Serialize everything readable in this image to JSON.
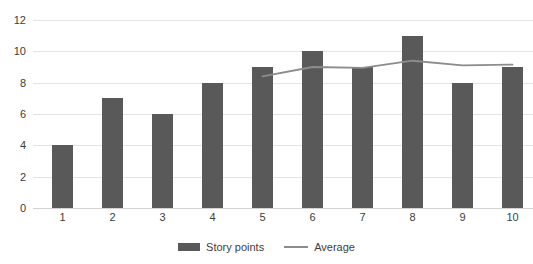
{
  "chart_data": {
    "type": "bar",
    "title": "",
    "subtitle": "",
    "xlabel": "",
    "ylabel": "",
    "categories": [
      "1",
      "2",
      "3",
      "4",
      "5",
      "6",
      "7",
      "8",
      "9",
      "10"
    ],
    "ylim": [
      0,
      12
    ],
    "y_ticks": [
      0,
      2,
      4,
      6,
      8,
      10,
      12
    ],
    "y_tick_labels": [
      "0",
      "2",
      "4",
      "6",
      "8",
      "10",
      "12"
    ],
    "grid": true,
    "legend_position": "bottom-center",
    "series": [
      {
        "name": "Story points",
        "type": "bar",
        "color": "#595959",
        "values": [
          4,
          7,
          6,
          8,
          9,
          10,
          9,
          11,
          8,
          9
        ]
      },
      {
        "name": "Average",
        "type": "line",
        "color": "#8c8c8c",
        "x": [
          "5",
          "6",
          "7",
          "8",
          "9",
          "10"
        ],
        "values": [
          8.4,
          9.0,
          8.95,
          9.4,
          9.1,
          9.15
        ]
      }
    ]
  },
  "legend": {
    "entries": [
      {
        "label": "Story points",
        "marker": "bar-swatch"
      },
      {
        "label": "Average",
        "marker": "line-swatch"
      }
    ]
  },
  "colors": {
    "bar": "#595959",
    "line": "#8c8c8c",
    "gridline": "#e3e3e3",
    "baseline": "#d2d2d2",
    "text": "#3d3d3d",
    "background": "#ffffff"
  }
}
